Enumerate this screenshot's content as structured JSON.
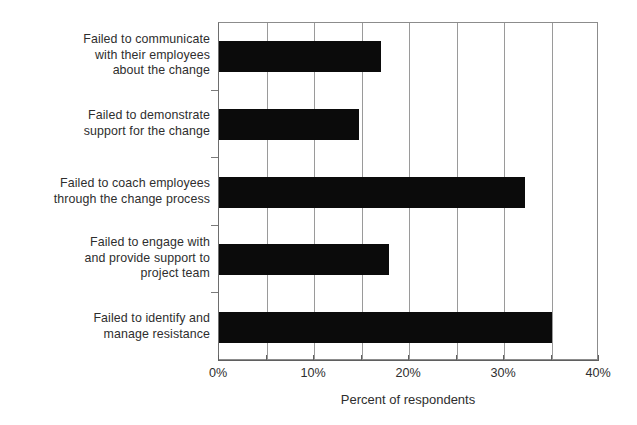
{
  "chart_data": {
    "type": "bar",
    "orientation": "horizontal",
    "title": "",
    "xlabel": "Percent of respondents",
    "ylabel": "",
    "xlim": [
      0,
      40
    ],
    "xunit": "%",
    "grid": true,
    "gridlines_every": 5,
    "legend": false,
    "categories": [
      "Failed to communicate\nwith their employees\nabout the change",
      "Failed to demonstrate\nsupport for the change",
      "Failed to coach employees\nthrough the change process",
      "Failed to engage with\nand provide support to\nproject team",
      "Failed to identify and\nmanage resistance"
    ],
    "values": [
      17,
      14.7,
      32.2,
      17.9,
      35
    ],
    "tick_labels": [
      "0%",
      "10%",
      "20%",
      "30%",
      "40%"
    ],
    "tick_values": [
      0,
      10,
      20,
      30,
      40
    ],
    "minor_tick_values": [
      0,
      5,
      10,
      15,
      20,
      25,
      30,
      35,
      40
    ],
    "bar_color": "#0b0b0b",
    "grid_color": "#9a9a9a",
    "axis_color": "#5f5f5f",
    "text_color": "#2e2e2e",
    "background_color": "#ffffff"
  }
}
